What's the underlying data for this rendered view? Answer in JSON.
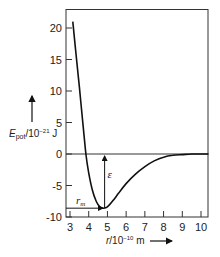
{
  "chart_data": {
    "type": "line",
    "title": "",
    "xlabel": "r / 10^-10 m",
    "ylabel": "E_pot / 10^-21 J",
    "xlabel_parts": {
      "var": "r",
      "unit_prefix": "/10",
      "exp": "-10",
      "unit": "m"
    },
    "ylabel_parts": {
      "var": "E",
      "sub": "pot",
      "unit_prefix": "/10",
      "exp": "-21",
      "unit": "J"
    },
    "xlim": [
      2.8,
      10.4
    ],
    "ylim": [
      -10,
      22.5
    ],
    "x_ticks": [
      3,
      4,
      5,
      6,
      7,
      8,
      9,
      10
    ],
    "x_tick_labels": [
      "3",
      "4",
      "5",
      "6",
      "7",
      "8",
      "9",
      "10"
    ],
    "y_ticks": [
      20,
      15,
      10,
      5,
      0,
      -5,
      -10
    ],
    "y_tick_labels": [
      "20",
      "15",
      "10",
      "5",
      "0",
      "-5",
      "-10"
    ],
    "grid": false,
    "series": [
      {
        "name": "Potential energy",
        "x": [
          3.15,
          3.3,
          3.5,
          3.7,
          3.85,
          4.0,
          4.2,
          4.4,
          4.6,
          4.8,
          5.0,
          5.3,
          5.6,
          6.0,
          6.5,
          7.0,
          7.5,
          8.0,
          8.5,
          9.0,
          9.5,
          10.0,
          10.4
        ],
        "y": [
          21.0,
          16.5,
          10.6,
          4.5,
          0.0,
          -3.0,
          -5.8,
          -7.5,
          -8.4,
          -8.6,
          -8.4,
          -7.4,
          -6.2,
          -4.7,
          -3.2,
          -2.0,
          -1.1,
          -0.5,
          -0.2,
          -0.1,
          0.0,
          0.0,
          0.0
        ]
      }
    ],
    "annotations": [
      {
        "text": "ε",
        "meaning": "well depth",
        "x": 4.85,
        "from_y": -8.6,
        "to_y": 0
      },
      {
        "text": "r_m",
        "meaning": "position of minimum",
        "x_from": 2.8,
        "x_to": 4.8,
        "y": -8.6
      }
    ],
    "reference_lines": [
      {
        "y": 0
      }
    ],
    "legend": null
  },
  "labels": {
    "y_var": "E",
    "y_sub": "pot",
    "y_unit_pre": "/10",
    "y_exp": "−21",
    "y_unit": " J",
    "x_var": "r",
    "x_unit_pre": "/10",
    "x_exp": "−10",
    "x_unit": " m",
    "epsilon": "ε",
    "rm_var": "r",
    "rm_sub": "m"
  }
}
